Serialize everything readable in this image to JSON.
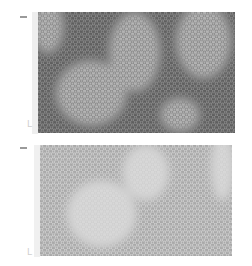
{
  "figure": {
    "panels": [
      {
        "id": "top",
        "label_mark": "-",
        "corner_glyph": "L",
        "base_color": "#5f5f5f",
        "hex_color": "#8a8a8a",
        "blob_color": "#b4b4b4",
        "blobs": [
          {
            "cx": 0.05,
            "cy": 0.12,
            "rx": 0.08,
            "ry": 0.22
          },
          {
            "cx": 0.49,
            "cy": 0.33,
            "rx": 0.13,
            "ry": 0.33
          },
          {
            "cx": 0.27,
            "cy": 0.67,
            "rx": 0.18,
            "ry": 0.27
          },
          {
            "cx": 0.84,
            "cy": 0.24,
            "rx": 0.14,
            "ry": 0.31
          },
          {
            "cx": 0.72,
            "cy": 0.85,
            "rx": 0.1,
            "ry": 0.14
          }
        ]
      },
      {
        "id": "bottom",
        "label_mark": "-",
        "corner_glyph": "L",
        "base_color": "#a9a9a9",
        "hex_color": "#cfcfcf",
        "blob_color": "#d8d8d8",
        "blobs": [
          {
            "cx": 0.32,
            "cy": 0.62,
            "rx": 0.18,
            "ry": 0.3
          },
          {
            "cx": 0.55,
            "cy": 0.25,
            "rx": 0.12,
            "ry": 0.25
          },
          {
            "cx": 0.95,
            "cy": 0.2,
            "rx": 0.06,
            "ry": 0.3
          }
        ]
      }
    ]
  }
}
